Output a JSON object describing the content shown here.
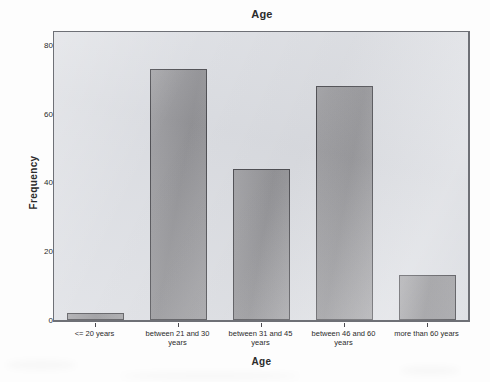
{
  "chart_data": {
    "type": "bar",
    "title": "Age",
    "xlabel": "Age",
    "ylabel": "Frequency",
    "categories": [
      "<= 20 years",
      "between 21 and 30 years",
      "between 31 and 45 years",
      "between 46 and 60 years",
      "more than 60 years"
    ],
    "values": [
      2,
      73,
      44,
      68,
      13
    ],
    "ylim": [
      0,
      84
    ],
    "yticks": [
      0,
      20,
      40,
      60,
      80
    ],
    "ytick_labels": [
      "0",
      "20",
      "40",
      "60",
      "80"
    ],
    "grid": false,
    "legend": "none",
    "bar_color": "#9a9a9e",
    "bar_edge_color": "#4d4d52",
    "panel_color": "#dcdee3",
    "text_color": "#2b2b2b"
  }
}
